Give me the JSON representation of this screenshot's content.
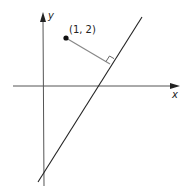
{
  "diagram": {
    "type": "coordinate-geometry",
    "axes": {
      "x_label": "x",
      "y_label": "y"
    },
    "point": {
      "label": "(1, 2)",
      "coords": [
        1,
        2
      ]
    },
    "elements": [
      "x-axis with arrow",
      "y-axis with arrow",
      "slanted line",
      "point (1, 2)",
      "perpendicular segment from point to line",
      "right-angle marker"
    ],
    "colors": {
      "axis": "#333333",
      "line": "#222222",
      "perpendicular": "#888888",
      "point": "#111111"
    }
  }
}
